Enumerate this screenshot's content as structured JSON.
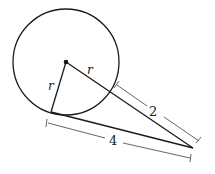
{
  "diagram": {
    "labels": {
      "radius_tangent": "r",
      "radius_secant": "r",
      "outside_segment": "2",
      "tangent_length": "4"
    },
    "colors": {
      "stroke": "#1a1a1a",
      "dimension": "#555555",
      "background": "#ffffff"
    }
  }
}
